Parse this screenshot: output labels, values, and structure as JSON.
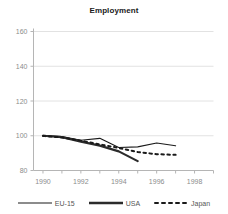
{
  "chart_data": {
    "type": "line",
    "title": "Employment",
    "xlabel": "",
    "ylabel": "",
    "xlim": [
      1989.5,
      1999.0
    ],
    "ylim": [
      80,
      160
    ],
    "xticks": [
      1990,
      1992,
      1994,
      1996,
      1998
    ],
    "yticks": [
      80,
      100,
      120,
      140,
      160
    ],
    "grid": true,
    "legend_position": "bottom",
    "series": [
      {
        "name": "EU-15",
        "style": "solid-thin",
        "color": "#1a1a1a",
        "x": [
          1990,
          1991,
          1992,
          1993,
          1994,
          1995,
          1996,
          1997
        ],
        "values": [
          100.2,
          99.6,
          97.4,
          98.5,
          93.2,
          93.6,
          95.8,
          94.2
        ]
      },
      {
        "name": "USA",
        "style": "solid-thick",
        "color": "#2b2b2b",
        "x": [
          1990,
          1991,
          1992,
          1993,
          1994,
          1995
        ],
        "values": [
          100.0,
          99.2,
          96.6,
          94.3,
          91.0,
          85.4
        ]
      },
      {
        "name": "Japan",
        "style": "dotted",
        "color": "#1a1a1a",
        "x": [
          1990,
          1991,
          1992,
          1993,
          1994,
          1995,
          1996,
          1997
        ],
        "values": [
          99.9,
          99.0,
          97.2,
          95.0,
          93.0,
          90.6,
          89.4,
          89.0
        ]
      }
    ]
  },
  "legend": {
    "items": [
      {
        "label": "EU-15"
      },
      {
        "label": "USA"
      },
      {
        "label": "Japan"
      }
    ]
  },
  "axis": {
    "ytick_0": "80",
    "ytick_1": "100",
    "ytick_2": "120",
    "ytick_3": "140",
    "ytick_4": "160",
    "xtick_0": "1990",
    "xtick_1": "1992",
    "xtick_2": "1994",
    "xtick_3": "1996",
    "xtick_4": "1998"
  },
  "colors": {
    "grid": "#e2e2e2",
    "axis": "#b5b5b5",
    "text": "#8c8c8c",
    "line": "#1a1a1a"
  }
}
